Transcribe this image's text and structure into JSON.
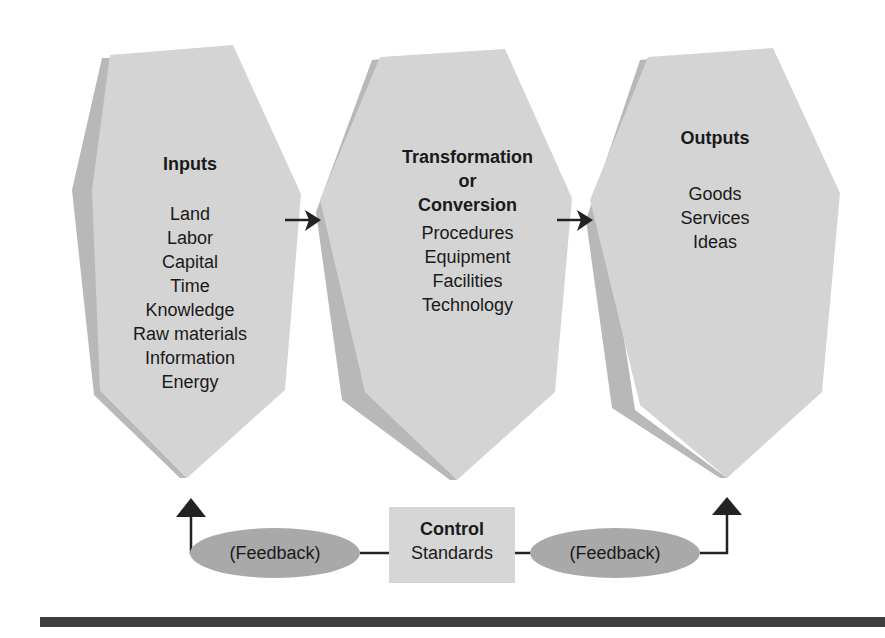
{
  "diagram": {
    "type": "process-flow",
    "stages": [
      {
        "id": "inputs",
        "title": "Inputs",
        "items": [
          "Land",
          "Labor",
          "Capital",
          "Time",
          "Knowledge",
          "Raw materials",
          "Information",
          "Energy"
        ]
      },
      {
        "id": "transformation",
        "title_lines": [
          "Transformation",
          "or",
          "Conversion"
        ],
        "items": [
          "Procedures",
          "Equipment",
          "Facilities",
          "Technology"
        ]
      },
      {
        "id": "outputs",
        "title": "Outputs",
        "items": [
          "Goods",
          "Services",
          "Ideas"
        ]
      }
    ],
    "control": {
      "title": "Control",
      "subtitle": "Standards"
    },
    "feedback": {
      "left_label": "(Feedback)",
      "right_label": "(Feedback)"
    },
    "colors": {
      "face": "#d4d4d4",
      "side": "#b8b8b8",
      "ellipse": "#a9a9a9",
      "control_box": "#d6d6d6",
      "line": "#222222",
      "rule": "#3d3d3d"
    }
  }
}
